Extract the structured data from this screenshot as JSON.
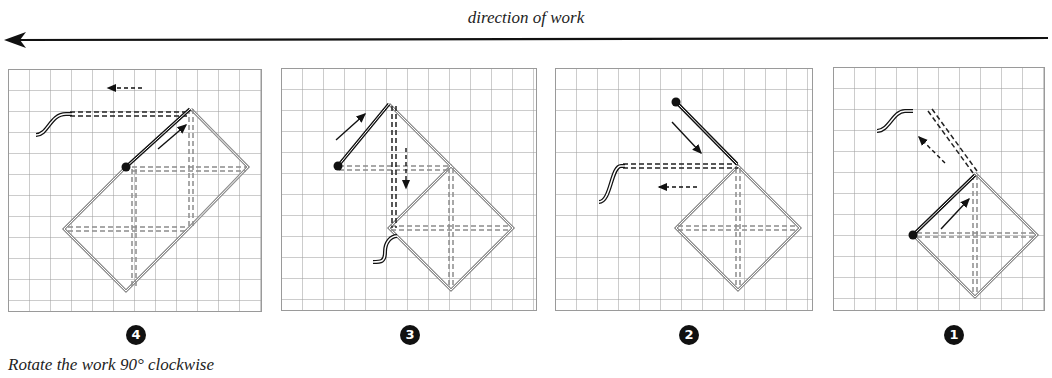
{
  "header": {
    "title": "direction of work",
    "arrow_direction": "left"
  },
  "panels": [
    {
      "step": "4",
      "step_glyph": "❹",
      "label": "panel-step-4"
    },
    {
      "step": "3",
      "step_glyph": "❸",
      "label": "panel-step-3"
    },
    {
      "step": "2",
      "step_glyph": "❷",
      "label": "panel-step-2"
    },
    {
      "step": "1",
      "step_glyph": "❶",
      "label": "panel-step-1"
    }
  ],
  "caption": "Rotate the work 90° clockwise",
  "colors": {
    "grid": "#9a9a9a",
    "stitch": "#8c8c8c",
    "thread": "#111111",
    "background": "#ffffff"
  }
}
